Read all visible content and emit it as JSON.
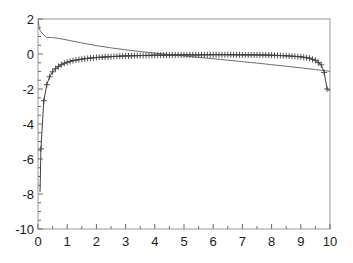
{
  "chart_data": {
    "type": "line",
    "title": "",
    "xlabel": "",
    "ylabel": "",
    "xlim": [
      0,
      10
    ],
    "ylim": [
      -10,
      2
    ],
    "grid": false,
    "legend": null,
    "x_ticks": [
      "0",
      "1",
      "2",
      "3",
      "4",
      "5",
      "6",
      "7",
      "8",
      "9",
      "10"
    ],
    "y_ticks": [
      "2",
      "0",
      "-2",
      "-4",
      "-6",
      "-8",
      "-10"
    ],
    "series": [
      {
        "name": "curve-upper",
        "style": "line",
        "color": "#6e6e6e",
        "x": [
          0,
          0.05,
          0.1,
          0.2,
          0.3,
          0.5,
          0.75,
          1,
          1.5,
          2,
          2.5,
          3,
          3.5,
          4,
          4.5,
          5,
          5.5,
          6,
          6.5,
          7,
          7.5,
          8,
          8.5,
          9,
          9.5,
          10
        ],
        "values": [
          2.0,
          1.42,
          1.27,
          1.08,
          0.95,
          0.94,
          0.88,
          0.8,
          0.63,
          0.48,
          0.35,
          0.24,
          0.14,
          0.05,
          -0.03,
          -0.11,
          -0.19,
          -0.27,
          -0.35,
          -0.44,
          -0.52,
          -0.61,
          -0.7,
          -0.79,
          -0.89,
          -0.99
        ]
      },
      {
        "name": "curve-marked",
        "style": "line+cross-markers",
        "color": "#404040",
        "x": [
          0.07,
          0.1,
          0.2,
          0.3,
          0.4,
          0.5,
          0.6,
          0.7,
          0.8,
          0.9,
          1.0,
          1.2,
          1.4,
          1.6,
          1.8,
          2.0,
          2.5,
          3.0,
          3.5,
          4.0,
          4.5,
          5.0,
          5.5,
          6.0,
          6.5,
          7.0,
          7.5,
          8.0,
          8.5,
          9.0,
          9.3,
          9.5,
          9.7,
          9.8,
          9.9,
          10.0
        ],
        "values": [
          -7.88,
          -5.42,
          -2.67,
          -1.75,
          -1.3,
          -1.02,
          -0.84,
          -0.71,
          -0.61,
          -0.53,
          -0.47,
          -0.38,
          -0.32,
          -0.27,
          -0.23,
          -0.2,
          -0.15,
          -0.11,
          -0.09,
          -0.07,
          -0.06,
          -0.05,
          -0.05,
          -0.04,
          -0.04,
          -0.05,
          -0.05,
          -0.07,
          -0.1,
          -0.16,
          -0.24,
          -0.36,
          -0.62,
          -1.06,
          -2.0,
          -2.1
        ]
      }
    ]
  }
}
